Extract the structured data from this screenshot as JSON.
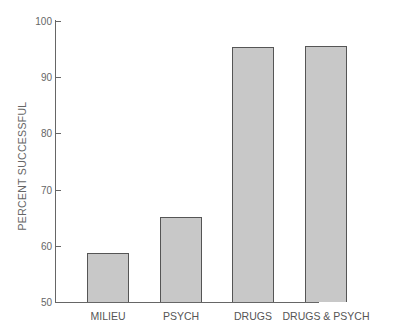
{
  "chart_data": {
    "type": "bar",
    "title": "",
    "xlabel": "",
    "ylabel": "PERCENT SUCCESSFUL",
    "categories": [
      "MILIEU",
      "PSYCH",
      "DRUGS",
      "DRUGS & PSYCH"
    ],
    "values": [
      58.8,
      65.2,
      95.4,
      95.6
    ],
    "ylim": [
      50,
      100
    ],
    "yticks": [
      50,
      60,
      70,
      80,
      90,
      100
    ],
    "grid": false,
    "legend": null,
    "bar_color": "#c8c8c8",
    "edge_color": "#555555"
  },
  "ytick_labels": [
    "50",
    "60",
    "70",
    "80",
    "90",
    "100"
  ]
}
